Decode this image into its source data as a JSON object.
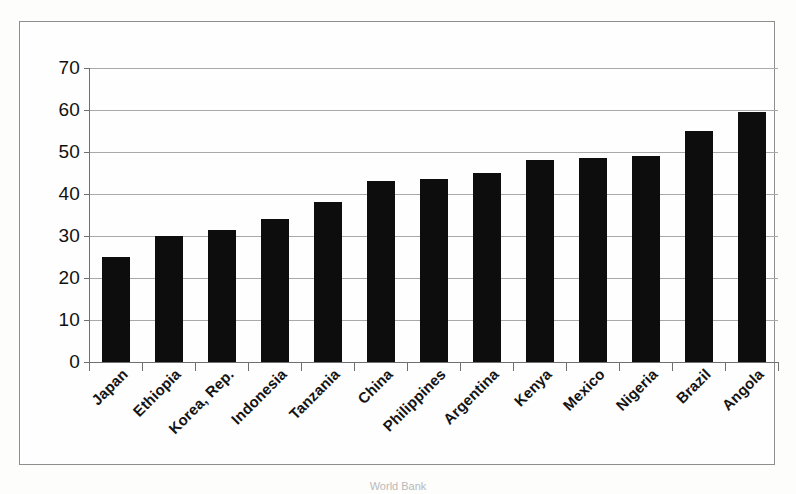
{
  "chart_data": {
    "type": "bar",
    "title": "",
    "subtitle": "",
    "xlabel": "",
    "ylabel": "",
    "categories": [
      "Japan",
      "Ethiopia",
      "Korea, Rep.",
      "Indonesia",
      "Tanzania",
      "China",
      "Philippines",
      "Argentina",
      "Kenya",
      "Mexico",
      "Nigeria",
      "Brazil",
      "Angola"
    ],
    "values": [
      25,
      30,
      31.5,
      34,
      38,
      43,
      43.5,
      45,
      48,
      48.5,
      49,
      55,
      59.5
    ],
    "ylim": [
      0,
      70
    ],
    "y_ticks": [
      0,
      10,
      20,
      30,
      40,
      50,
      60,
      70
    ],
    "y_tick_labels": [
      "0",
      "10",
      "20",
      "30",
      "40",
      "50",
      "60",
      "70"
    ],
    "grid": true,
    "legend": false,
    "legend_position": "none",
    "bar_color": "#0d0d0d",
    "gridline_color": "#a9a9a9",
    "axis_color": "#6f6f6f",
    "frame_color": "#8e8e8e",
    "background_color": "#fefefe"
  },
  "caption": {
    "source": "World Bank"
  }
}
